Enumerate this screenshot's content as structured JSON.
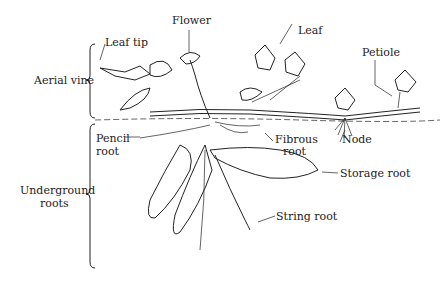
{
  "diagram": {
    "colors": {
      "ink": "#222222",
      "background": "#ffffff"
    },
    "groups": [
      {
        "label": "Aerial vine"
      },
      {
        "label_line1": "Underground",
        "label_line2": "roots"
      }
    ],
    "labels": {
      "flower": "Flower",
      "leaf_tip": "Leaf tip",
      "leaf": "Leaf",
      "petiole": "Petiole",
      "aerial_vine": "Aerial vine",
      "pencil_root_1": "Pencil",
      "pencil_root_2": "root",
      "fibrous_root_1": "Fibrous",
      "fibrous_root_2": "root",
      "node": "Node",
      "storage_root": "Storage root",
      "underground_1": "Underground",
      "underground_2": "roots",
      "string_root": "String root"
    }
  }
}
